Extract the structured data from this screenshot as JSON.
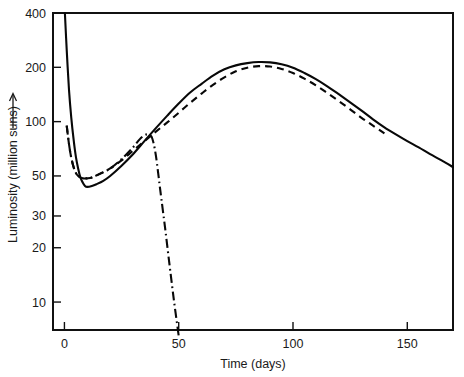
{
  "chart_data": {
    "type": "line",
    "title": "",
    "xlabel": "Time (days)",
    "ylabel": "Luminosity (million suns)",
    "ylabel_arrow": "↑",
    "xlim": [
      -5,
      170
    ],
    "ylim": [
      7,
      400
    ],
    "yscale": "log",
    "xscale": "linear",
    "grid": false,
    "legend": "none",
    "xticks": [
      0,
      50,
      100,
      150
    ],
    "xtick_labels": [
      "0",
      "50",
      "100",
      "150"
    ],
    "yticks": [
      10,
      20,
      30,
      50,
      100,
      200,
      400
    ],
    "ytick_labels": [
      "10",
      "20",
      "30",
      "50",
      "100",
      "200",
      "400"
    ],
    "series": [
      {
        "name": "solid-curve",
        "style": "solid",
        "x": [
          0.2,
          1,
          2,
          3,
          4,
          5,
          6,
          7,
          8,
          9,
          10,
          12,
          14,
          17,
          20,
          25,
          30,
          35,
          40,
          45,
          50,
          55,
          60,
          65,
          70,
          75,
          80,
          85,
          90,
          95,
          100,
          105,
          110,
          115,
          120,
          125,
          130,
          135,
          140,
          145,
          150,
          155,
          160,
          165,
          170
        ],
        "y": [
          400,
          250,
          150,
          105,
          80,
          64,
          55,
          49,
          46,
          44,
          43.5,
          44,
          45,
          47,
          50,
          57,
          66,
          78,
          92,
          108,
          126,
          145,
          162,
          180,
          195,
          205,
          211,
          214,
          213,
          208,
          199,
          186,
          172,
          157,
          142,
          128,
          115,
          103,
          93,
          85,
          78,
          72,
          66,
          61,
          56
        ]
      },
      {
        "name": "dashed-curve",
        "style": "dashed",
        "x": [
          1,
          2,
          3,
          4,
          5,
          6,
          8,
          10,
          12,
          15,
          20,
          25,
          30,
          35,
          40,
          45,
          50,
          55,
          60,
          65,
          70,
          75,
          80,
          85,
          90,
          95,
          100,
          105,
          110,
          115,
          120,
          125,
          130,
          135,
          140
        ],
        "y": [
          95,
          75,
          63,
          56,
          52,
          50,
          48.5,
          48.5,
          49,
          51,
          55,
          61,
          69,
          78,
          88,
          99,
          112,
          127,
          143,
          160,
          176,
          190,
          199,
          203,
          202,
          196,
          186,
          173,
          159,
          144,
          130,
          117,
          105,
          95,
          86
        ]
      },
      {
        "name": "dash-dot-curve",
        "style": "dash-dot",
        "x": [
          1,
          2,
          3,
          4,
          5,
          6,
          8,
          10,
          12,
          15,
          20,
          25,
          30,
          33,
          35,
          36.5,
          38,
          39,
          40,
          41,
          42,
          44,
          46,
          48,
          50
        ],
        "y": [
          95,
          75,
          63,
          56,
          52,
          50,
          48.5,
          48.5,
          49,
          51,
          55,
          62,
          72,
          80,
          84,
          85,
          83,
          76,
          65,
          52,
          41,
          26,
          16,
          10,
          6.5
        ]
      }
    ]
  },
  "axes": {
    "y_axis_name": "luminosity-axis",
    "x_axis_name": "time-axis"
  }
}
